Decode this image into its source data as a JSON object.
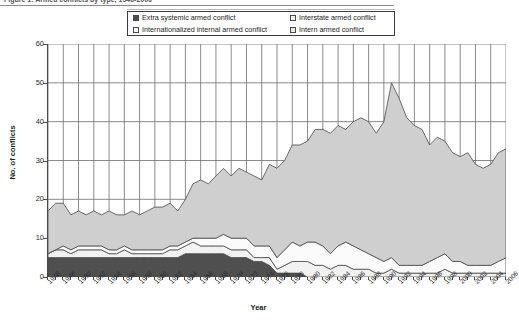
{
  "figure": {
    "caption": "Figure 1: Armed conflicts by type, 1946-2006"
  },
  "legend": {
    "position": "top",
    "items": [
      {
        "label": "Extra systemic armed conflict",
        "color": "#4f4f4f"
      },
      {
        "label": "Interstate armed conflict",
        "color": "#f2f2f2"
      },
      {
        "label": "Internationalized internal armed conflict",
        "color": "#fbfbfb"
      },
      {
        "label": "Intern armed conflict",
        "color": "#cfcfcf"
      }
    ]
  },
  "axes": {
    "ylabel": "No. of conflicts",
    "xlabel": "Year",
    "yticks": [
      0,
      10,
      20,
      30,
      40,
      50,
      60
    ],
    "ylim": [
      0,
      60
    ]
  },
  "chart_data": {
    "type": "area",
    "stacked": true,
    "title": "Armed conflicts by type, 1946-2006",
    "xlabel": "Year",
    "ylabel": "No. of conflicts",
    "ylim": [
      0,
      60
    ],
    "grid": true,
    "legend_position": "top",
    "x": [
      1946,
      1947,
      1948,
      1949,
      1950,
      1951,
      1952,
      1953,
      1954,
      1955,
      1956,
      1957,
      1958,
      1959,
      1960,
      1961,
      1962,
      1963,
      1964,
      1965,
      1966,
      1967,
      1968,
      1969,
      1970,
      1971,
      1972,
      1973,
      1974,
      1975,
      1976,
      1977,
      1978,
      1979,
      1980,
      1981,
      1982,
      1983,
      1984,
      1985,
      1986,
      1987,
      1988,
      1989,
      1990,
      1991,
      1992,
      1993,
      1994,
      1995,
      1996,
      1997,
      1998,
      1999,
      2000,
      2001,
      2002,
      2003,
      2004,
      2005,
      2006
    ],
    "xtick_labels": [
      1946,
      1948,
      1950,
      1952,
      1954,
      1956,
      1958,
      1960,
      1962,
      1964,
      1966,
      1968,
      1970,
      1972,
      1974,
      1976,
      1978,
      1980,
      1982,
      1984,
      1986,
      1988,
      1990,
      1992,
      1994,
      1996,
      1998,
      2000,
      2002,
      2004,
      2006
    ],
    "series": [
      {
        "name": "Extra systemic armed conflict",
        "color": "#4f4f4f",
        "values": [
          5,
          5,
          5,
          5,
          5,
          5,
          5,
          5,
          5,
          5,
          5,
          5,
          5,
          5,
          5,
          5,
          5,
          5,
          6,
          6,
          6,
          6,
          6,
          6,
          5,
          5,
          5,
          4,
          4,
          3,
          1,
          1,
          1,
          1,
          0,
          0,
          0,
          0,
          0,
          0,
          0,
          0,
          0,
          0,
          0,
          0,
          0,
          0,
          0,
          0,
          0,
          0,
          0,
          0,
          0,
          0,
          0,
          0,
          0,
          0,
          0
        ]
      },
      {
        "name": "Interstate armed conflict",
        "color": "#f2f2f2",
        "values": [
          1,
          2,
          2,
          1,
          2,
          2,
          2,
          2,
          1,
          1,
          2,
          1,
          1,
          1,
          1,
          1,
          2,
          2,
          2,
          3,
          2,
          2,
          2,
          2,
          2,
          2,
          2,
          1,
          1,
          2,
          1,
          2,
          3,
          3,
          4,
          3,
          3,
          2,
          3,
          3,
          2,
          2,
          2,
          1,
          1,
          2,
          1,
          1,
          1,
          1,
          1,
          1,
          2,
          1,
          1,
          1,
          1,
          1,
          1,
          1,
          1
        ]
      },
      {
        "name": "Internationalized internal armed conflict",
        "color": "#fbfbfb",
        "values": [
          0,
          0,
          1,
          1,
          1,
          1,
          1,
          1,
          1,
          1,
          1,
          1,
          1,
          1,
          1,
          1,
          1,
          1,
          1,
          1,
          2,
          2,
          2,
          3,
          3,
          3,
          3,
          3,
          3,
          3,
          3,
          4,
          5,
          4,
          5,
          6,
          5,
          4,
          5,
          6,
          6,
          5,
          4,
          4,
          3,
          3,
          2,
          2,
          2,
          2,
          3,
          4,
          4,
          3,
          3,
          2,
          2,
          2,
          2,
          3,
          4
        ]
      },
      {
        "name": "Intern armed conflict",
        "color": "#cfcfcf",
        "values": [
          11,
          12,
          11,
          9,
          9,
          8,
          9,
          8,
          10,
          9,
          8,
          10,
          9,
          10,
          11,
          11,
          11,
          9,
          11,
          14,
          15,
          14,
          16,
          17,
          16,
          18,
          17,
          18,
          17,
          21,
          23,
          23,
          25,
          26,
          26,
          29,
          30,
          31,
          31,
          29,
          32,
          34,
          34,
          32,
          36,
          45,
          43,
          38,
          36,
          35,
          30,
          31,
          29,
          28,
          27,
          29,
          26,
          25,
          26,
          28,
          28
        ]
      }
    ],
    "totals_note": "Total peaks at 52 in 1991-1992 and is 34 in 2006"
  }
}
